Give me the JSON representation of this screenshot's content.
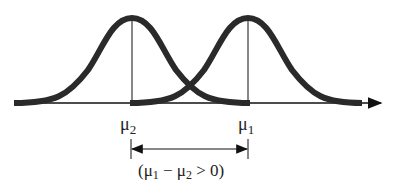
{
  "diagram": {
    "type": "two overlapping normal distributions",
    "curves": [
      {
        "name": "distribution-2",
        "mean_label": "μ2",
        "peak_x": 132
      },
      {
        "name": "distribution-1",
        "mean_label": "μ1",
        "peak_x": 248
      }
    ],
    "labels": {
      "mu2_base": "μ",
      "mu2_sub": "2",
      "mu1_base": "μ",
      "mu1_sub": "1"
    },
    "difference_annotation": {
      "open": "(μ",
      "sub1": "1",
      "mid": " − μ",
      "sub2": "2",
      "close": " > 0)"
    },
    "colors": {
      "curve": "#2a2a2a",
      "line": "#111111"
    }
  }
}
